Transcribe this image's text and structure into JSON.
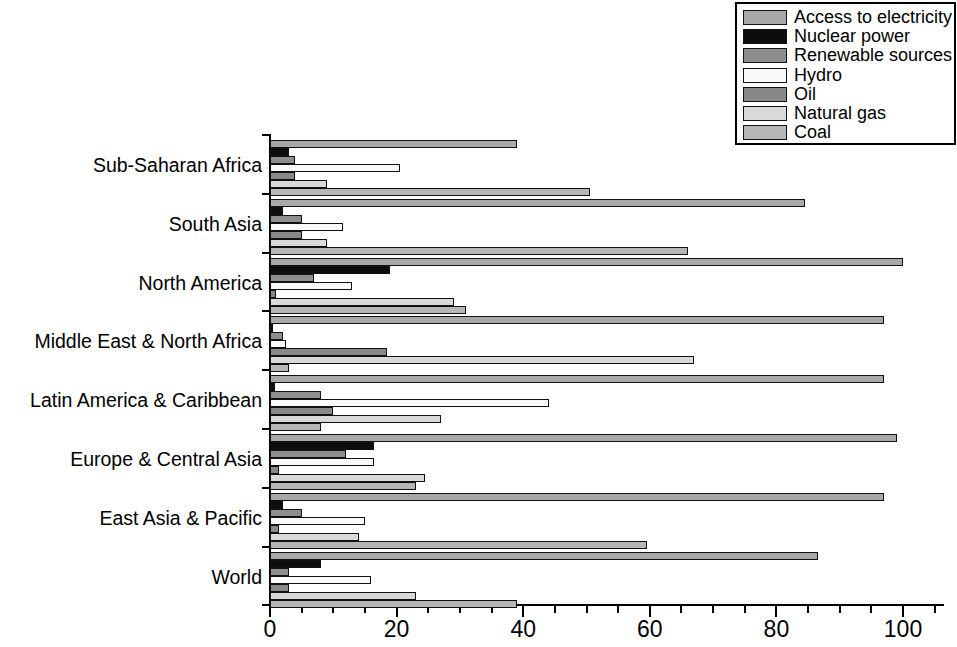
{
  "chart_data": {
    "type": "bar",
    "orientation": "horizontal",
    "title": "",
    "xlabel": "",
    "ylabel": "",
    "xlim": [
      0,
      107
    ],
    "grid": false,
    "legend_position": "top-right",
    "xticks_major": [
      0,
      20,
      40,
      60,
      80,
      100
    ],
    "xtick_labels": [
      "0",
      "20",
      "40",
      "60",
      "80",
      "100"
    ],
    "xticks_minor_step": 5,
    "categories": [
      "Sub-Saharan Africa",
      "South Asia",
      "North America",
      "Middle East & North Africa",
      "Latin America & Caribbean",
      "Europe & Central Asia",
      "East Asia & Pacific",
      "World"
    ],
    "series": [
      {
        "name": "Access to electricity",
        "color": "#a8a8a8",
        "values": [
          39.0,
          84.5,
          100.0,
          97.0,
          97.0,
          99.0,
          97.0,
          86.5
        ]
      },
      {
        "name": "Nuclear power",
        "color": "#0d0d0d",
        "values": [
          3.0,
          2.0,
          19.0,
          0.4,
          0.8,
          16.5,
          2.0,
          8.0
        ]
      },
      {
        "name": "Renewable sources",
        "color": "#8e8e8e",
        "values": [
          4.0,
          5.0,
          7.0,
          2.0,
          8.0,
          12.0,
          5.0,
          3.0
        ]
      },
      {
        "name": "Hydro",
        "color": "#fafafa",
        "values": [
          20.5,
          11.5,
          13.0,
          2.5,
          44.0,
          16.5,
          15.0,
          16.0
        ]
      },
      {
        "name": "Oil",
        "color": "#888888",
        "values": [
          4.0,
          5.0,
          1.0,
          18.5,
          10.0,
          1.5,
          1.5,
          3.0
        ]
      },
      {
        "name": "Natural gas",
        "color": "#d9d9d9",
        "values": [
          9.0,
          9.0,
          29.0,
          67.0,
          27.0,
          24.5,
          14.0,
          23.0
        ]
      },
      {
        "name": "Coal",
        "color": "#b6b6b6",
        "values": [
          50.5,
          66.0,
          31.0,
          3.0,
          8.0,
          23.0,
          59.5,
          39.0
        ]
      }
    ]
  },
  "legend": {
    "items": [
      {
        "label": "Access to electricity",
        "color": "#a8a8a8"
      },
      {
        "label": "Nuclear power",
        "color": "#0d0d0d"
      },
      {
        "label": "Renewable sources",
        "color": "#8e8e8e"
      },
      {
        "label": "Hydro",
        "color": "#fafafa"
      },
      {
        "label": "Oil",
        "color": "#888888"
      },
      {
        "label": "Natural gas",
        "color": "#d9d9d9"
      },
      {
        "label": "Coal",
        "color": "#b6b6b6"
      }
    ]
  }
}
